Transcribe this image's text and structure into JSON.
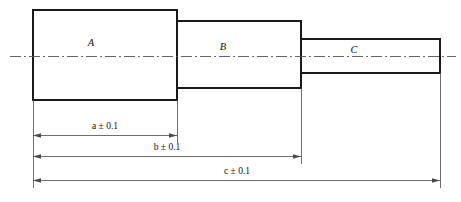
{
  "drawing": {
    "title": "Stepped shaft sectional outline with linear dimensions",
    "ink_color": "#1a1a1a",
    "dim_color": "#4a4a4a",
    "centerline_color": "#555555",
    "background": "#ffffff",
    "parts": [
      {
        "id": "A",
        "label": "A",
        "label_x": 91,
        "label_y": 44,
        "x1": 33,
        "y1": 10,
        "x2": 177,
        "y2": 100
      },
      {
        "id": "B",
        "label": "B",
        "label_x": 223,
        "label_y": 48,
        "x1": 177,
        "y1": 21,
        "x2": 301,
        "y2": 88
      },
      {
        "id": "C",
        "label": "C",
        "label_x": 354,
        "label_y": 51,
        "x1": 301,
        "y1": 39,
        "x2": 440,
        "y2": 73
      }
    ],
    "centerline": {
      "y": 56,
      "x1": 10,
      "x2": 456
    },
    "dimensions": [
      {
        "id": "a",
        "label": "a",
        "tolerance": "± 0.1",
        "full_label": "a ± 0.1",
        "x1": 33,
        "x2": 177,
        "line_y": 135,
        "label_x": 105,
        "label_y": 128,
        "ext_top_y": 100
      },
      {
        "id": "b",
        "label": "b",
        "tolerance": "± 0.1",
        "full_label": "b ± 0.1",
        "x1": 33,
        "x2": 301,
        "line_y": 156,
        "label_x": 167,
        "label_y": 149,
        "ext_top_y": 88
      },
      {
        "id": "c",
        "label": "c",
        "tolerance": "± 0.1",
        "full_label": "c ± 0.1",
        "x1": 33,
        "x2": 440,
        "line_y": 180,
        "label_x": 237,
        "label_y": 173,
        "ext_top_y": 73
      }
    ]
  }
}
